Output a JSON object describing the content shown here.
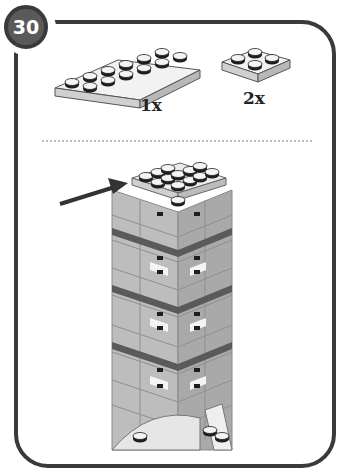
{
  "step": {
    "number": "30"
  },
  "parts_list": [
    {
      "name": "plate-2x6",
      "quantity": "1x"
    },
    {
      "name": "plate-2x2",
      "quantity": "2x"
    }
  ],
  "colors": {
    "frame": "#3a3a3a",
    "badge_fill": "#5a5a5a",
    "brick_light": "#d8d8d8",
    "brick_mid": "#b8b8b8",
    "brick_dark": "#a0a0a0",
    "stripe": "#5a5a5a",
    "stud_top": "#1e1e1e",
    "divider": "#bdbdbd"
  },
  "annotations": {
    "arrow": "placement-arrow"
  }
}
